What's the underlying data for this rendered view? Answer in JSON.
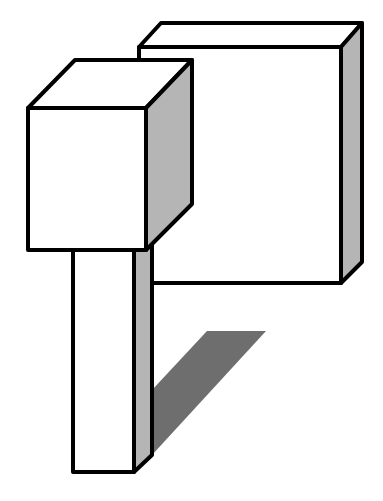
{
  "figure": {
    "colors": {
      "background": "#ffffff",
      "outline": "#000000",
      "face_light": "#ffffff",
      "face_side": "#b5b5b5",
      "shadow": "#6e6e6e"
    },
    "shapes": [
      {
        "id": "back-panel",
        "label": "large thin box (back)"
      },
      {
        "id": "cube",
        "label": "small cube (front-left)"
      },
      {
        "id": "pillar",
        "label": "tall pillar (below cube)"
      },
      {
        "id": "shadow",
        "label": "cast shadow (parallelogram)"
      }
    ]
  }
}
